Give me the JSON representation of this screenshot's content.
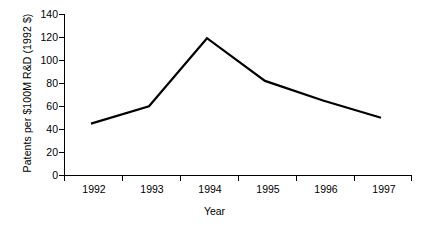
{
  "chart_data": {
    "type": "line",
    "title": "",
    "xlabel": "Year",
    "ylabel": "Patents per $100M R&D (1992 $)",
    "categories": [
      "1992",
      "1993",
      "1994",
      "1995",
      "1996",
      "1997"
    ],
    "values": [
      45,
      60,
      119,
      82,
      65,
      50
    ],
    "series": [
      {
        "name": "Patents per $100M R&D",
        "values": [
          45,
          60,
          119,
          82,
          65,
          50
        ]
      }
    ],
    "ylim": [
      0,
      140
    ],
    "yticks": [
      0,
      20,
      40,
      60,
      80,
      100,
      120,
      140
    ],
    "ytick_labels": [
      "0",
      "20",
      "40",
      "60",
      "80",
      "100",
      "120",
      "140"
    ],
    "xtick_labels": [
      "1992",
      "1993",
      "1994",
      "1995",
      "1996",
      "1997"
    ],
    "grid": false,
    "legend": false,
    "legend_position": "none",
    "line_color": "#000000",
    "background_color": "#ffffff",
    "axis_color": "#000000"
  }
}
